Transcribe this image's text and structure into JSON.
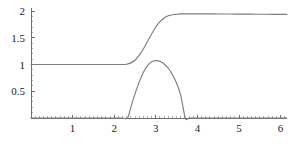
{
  "figure": {
    "title": "",
    "width": 288,
    "height": 146,
    "background": "#ffffff",
    "curve_color": "#7d7d7d",
    "axis_color": "#6e6e6e",
    "label_color": "#1a1a1a"
  },
  "chart_data": {
    "type": "line",
    "title": "",
    "xlabel": "",
    "ylabel": "",
    "xlim": [
      0,
      6.15
    ],
    "ylim": [
      0,
      2.05
    ],
    "grid": false,
    "legend": null,
    "legend_position": "none",
    "x_ticks": [
      1,
      2,
      3,
      4,
      5,
      6
    ],
    "x_tick_labels": [
      "1",
      "2",
      "3",
      "4",
      "5",
      "6"
    ],
    "x_minor_tick_step": 0.1,
    "y_ticks": [
      0.5,
      1,
      1.5,
      2
    ],
    "y_tick_labels": [
      "0.5",
      "1",
      "1.5",
      "2"
    ],
    "y_minor_tick_step": 0.1,
    "series": [
      {
        "name": "sigmoid-step",
        "color": "#7d7d7d",
        "x": [
          0.0,
          0.2,
          0.4,
          0.6,
          0.8,
          1.0,
          1.2,
          1.4,
          1.6,
          1.8,
          2.0,
          2.1,
          2.2,
          2.3,
          2.4,
          2.5,
          2.6,
          2.7,
          2.8,
          2.9,
          3.0,
          3.1,
          3.2,
          3.3,
          3.4,
          3.5,
          3.6,
          3.7,
          3.8,
          3.9,
          4.0,
          4.2,
          4.4,
          4.6,
          4.8,
          5.0,
          5.2,
          5.4,
          5.6,
          5.8,
          6.0,
          6.15
        ],
        "y": [
          1.0,
          1.0,
          1.0,
          1.0,
          1.0,
          1.0,
          1.0,
          1.0,
          1.0,
          1.0,
          1.0,
          1.0,
          1.0,
          1.005,
          1.03,
          1.08,
          1.17,
          1.29,
          1.43,
          1.57,
          1.7,
          1.8,
          1.87,
          1.91,
          1.93,
          1.94,
          1.945,
          1.946,
          1.946,
          1.946,
          1.946,
          1.946,
          1.945,
          1.944,
          1.943,
          1.942,
          1.941,
          1.94,
          1.939,
          1.938,
          1.937,
          1.936
        ]
      },
      {
        "name": "bump",
        "color": "#7d7d7d",
        "x": [
          0.0,
          0.5,
          1.0,
          1.5,
          2.0,
          2.2,
          2.32,
          2.4,
          2.5,
          2.6,
          2.7,
          2.8,
          2.9,
          3.0,
          3.1,
          3.2,
          3.3,
          3.4,
          3.5,
          3.6,
          3.71,
          3.8,
          4.0,
          4.5,
          5.0,
          5.5,
          6.0,
          6.15
        ],
        "y": [
          0.0,
          0.0,
          0.0,
          0.0,
          0.0,
          0.0,
          0.0,
          0.2,
          0.45,
          0.67,
          0.85,
          0.98,
          1.05,
          1.072,
          1.06,
          1.01,
          0.93,
          0.81,
          0.65,
          0.42,
          0.0,
          0.0,
          0.0,
          0.0,
          0.0,
          0.0,
          0.0,
          0.0
        ]
      }
    ],
    "annotations": []
  }
}
